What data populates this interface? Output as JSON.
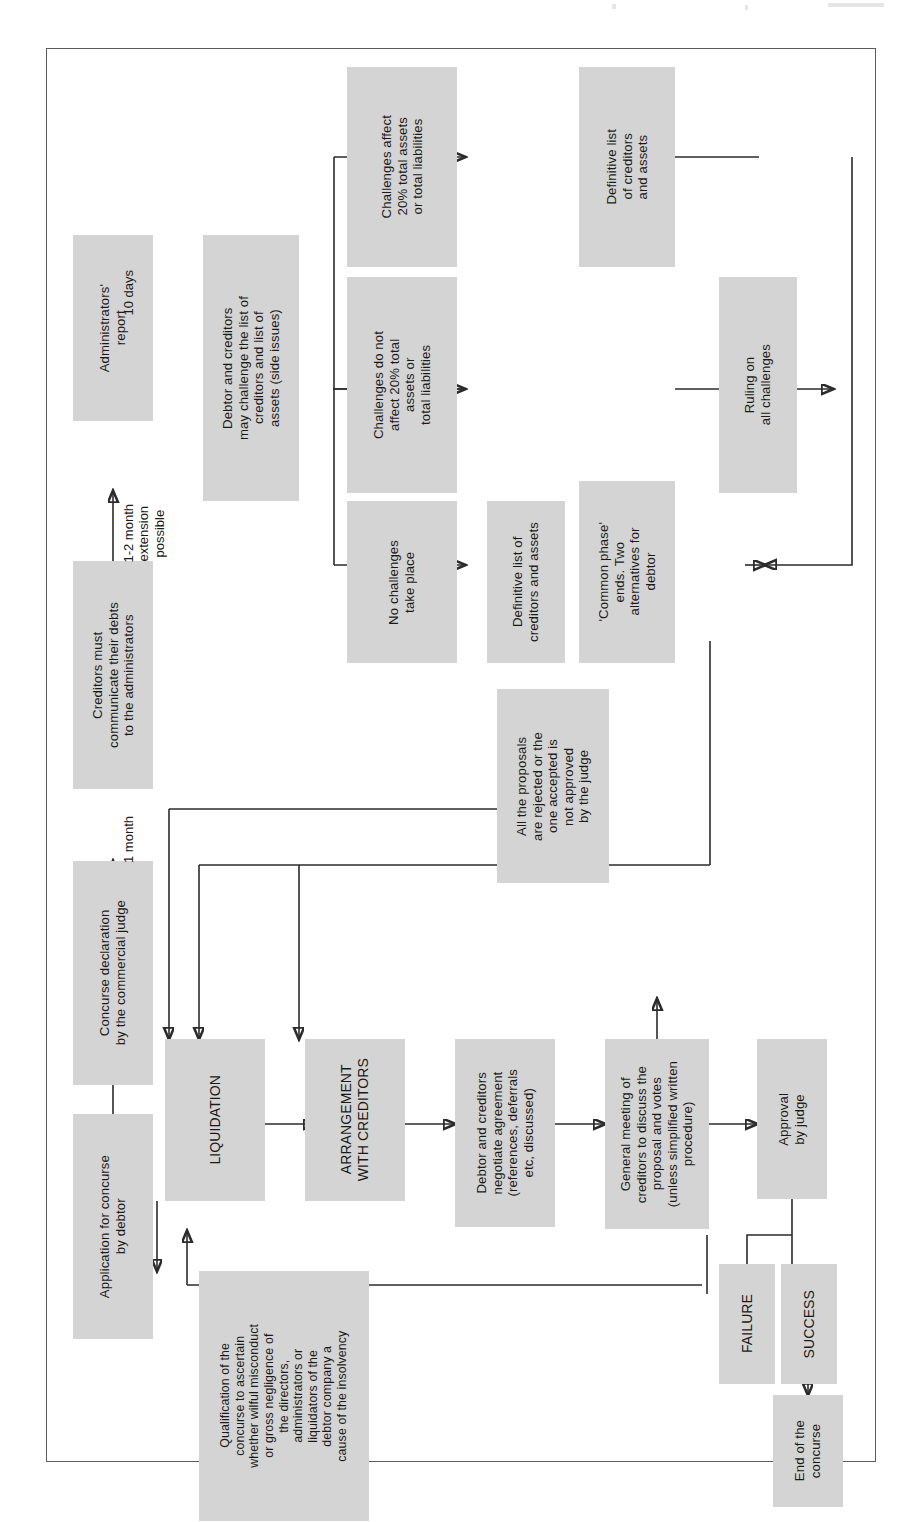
{
  "meta": {
    "diagram_title": "Concurse (insolvency) procedure flowchart",
    "orientation": "text rotated 90 degrees counter-clockwise",
    "node_fill": "#d4d4d4",
    "line_color": "#2b2b2b",
    "frame_color": "#5c5c5c"
  },
  "nodes": {
    "application": "Application for concurse\nby debtor",
    "declaration": "Concurse declaration\nby the commercial judge",
    "creditors_communicate": "Creditors must\ncommunicate their debts\nto the administrators",
    "admin_report": "Administrators'\nreport",
    "may_challenge": "Debtor and creditors\nmay challenge the list of\ncreditors and list of\nassets (side issues)",
    "challenges_affect": "Challenges affect\n20% total assets\nor total liabilities",
    "challenges_not_affect": "Challenges do not\naffect 20% total\nassets or\ntotal liabilities",
    "no_challenges": "No challenges\ntake place",
    "definitive_top": "Definitive list\nof creditors\nand assets",
    "definitive_mid": "Definitive list of\ncreditors and assets",
    "ruling": "Ruling on\nall challenges",
    "common_phase": "'Common phase'\nends. Two\nalternatives for\ndebtor",
    "all_rejected": "All the proposals\nare rejected or the\none accepted is\nnot approved\nby the judge",
    "liquidation": "LIQUIDATION",
    "arrangement": "ARRANGEMENT\nWITH CREDITORS",
    "negotiate": "Debtor and creditors\nnegotiate agreement\n(references, deferrals\netc, discussed)",
    "general_meeting": "General meeting of\ncreditors to discuss the\nproposal and votes\n(unless simplified written\nprocedure)",
    "approval": "Approval\nby judge",
    "failure": "FAILURE",
    "success": "SUCCESS",
    "end": "End of the\nconcurse",
    "qualification": "Qualification of the\nconcurse to ascertain\nwhether wilful misconduct\nor gross negligence of\nthe directors,\nadministrators or\nliquidators of the\ndebtor company a\ncause of the insolvency"
  },
  "edge_labels": {
    "one_month": "1 month",
    "extension": "1-2 month\nextension\npossible",
    "ten_days": "10 days"
  }
}
